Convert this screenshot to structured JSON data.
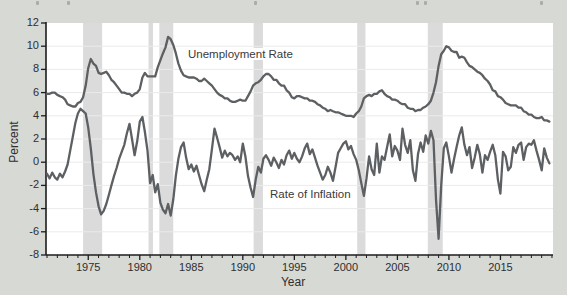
{
  "figure": {
    "ylabel": "Percent",
    "xlabel": "Year",
    "unemployment_label": "Unemployment Rate",
    "inflation_label": "Rate of Inflation"
  },
  "chart_data": {
    "type": "line",
    "title": "",
    "xlabel": "Year",
    "ylabel": "Percent",
    "xlim": [
      1970.9,
      2020.1
    ],
    "ylim": [
      -8,
      12
    ],
    "x_ticks": [
      1975,
      1980,
      1985,
      1990,
      1995,
      2000,
      2005,
      2010,
      2015
    ],
    "y_ticks": [
      12,
      10,
      8,
      6,
      4,
      2,
      0,
      -2,
      -4,
      -6,
      -8
    ],
    "grid": true,
    "x_start_year": 1971,
    "points_per_year": 4,
    "recession_bands": [
      [
        1974.5,
        1976.35
      ],
      [
        1980.85,
        1981.28
      ],
      [
        1981.9,
        1983.25
      ],
      [
        1991.05,
        1991.95
      ],
      [
        2001.1,
        2001.9
      ],
      [
        2007.95,
        2009.4
      ]
    ],
    "series": [
      {
        "name": "Unemployment Rate",
        "values": [
          5.9,
          5.9,
          6.0,
          6.0,
          5.8,
          5.7,
          5.6,
          5.4,
          5.0,
          4.9,
          4.8,
          4.8,
          5.1,
          5.2,
          5.6,
          6.6,
          8.1,
          8.9,
          8.5,
          8.3,
          7.7,
          7.6,
          7.7,
          7.8,
          7.5,
          7.1,
          6.9,
          6.6,
          6.3,
          6.0,
          6.0,
          5.9,
          5.9,
          5.7,
          5.9,
          6.0,
          6.3,
          7.3,
          7.7,
          7.4,
          7.4,
          7.4,
          7.4,
          8.2,
          8.8,
          9.4,
          9.9,
          10.8,
          10.6,
          10.1,
          9.4,
          8.5,
          7.9,
          7.5,
          7.4,
          7.3,
          7.3,
          7.3,
          7.2,
          7.0,
          7.0,
          7.2,
          7.0,
          6.8,
          6.6,
          6.3,
          6.0,
          5.8,
          5.7,
          5.5,
          5.5,
          5.3,
          5.2,
          5.2,
          5.3,
          5.4,
          5.3,
          5.3,
          5.7,
          6.1,
          6.6,
          6.8,
          6.9,
          7.1,
          7.4,
          7.6,
          7.6,
          7.4,
          7.1,
          7.1,
          6.8,
          6.6,
          6.6,
          6.2,
          6.0,
          5.6,
          5.5,
          5.7,
          5.7,
          5.6,
          5.5,
          5.5,
          5.3,
          5.3,
          5.2,
          5.0,
          4.9,
          4.7,
          4.6,
          4.4,
          4.5,
          4.4,
          4.3,
          4.3,
          4.2,
          4.1,
          4.0,
          4.0,
          4.0,
          3.9,
          4.2,
          4.4,
          4.8,
          5.5,
          5.7,
          5.8,
          5.7,
          5.9,
          5.9,
          6.1,
          6.2,
          5.9,
          5.7,
          5.6,
          5.4,
          5.4,
          5.3,
          5.1,
          5.0,
          5.0,
          4.7,
          4.6,
          4.6,
          4.4,
          4.5,
          4.5,
          4.7,
          4.8,
          5.0,
          5.3,
          6.0,
          6.9,
          8.3,
          9.3,
          9.6,
          10.0,
          9.9,
          9.6,
          9.5,
          9.5,
          9.0,
          9.1,
          9.0,
          8.6,
          8.3,
          8.2,
          8.0,
          7.8,
          7.7,
          7.5,
          7.2,
          7.0,
          6.7,
          6.2,
          6.1,
          5.7,
          5.6,
          5.4,
          5.1,
          5.0,
          4.9,
          4.9,
          4.9,
          4.7,
          4.7,
          4.4,
          4.3,
          4.1,
          4.1,
          3.9,
          3.8,
          3.8,
          3.9,
          3.6,
          3.6,
          3.5
        ]
      },
      {
        "name": "Rate of Inflation",
        "values": [
          -1.0,
          -1.4,
          -0.9,
          -1.3,
          -1.5,
          -1.0,
          -1.3,
          -0.8,
          -0.2,
          1.0,
          2.2,
          3.4,
          4.2,
          4.6,
          4.4,
          4.2,
          3.0,
          1.2,
          -1.0,
          -2.6,
          -3.8,
          -4.5,
          -4.2,
          -3.6,
          -2.8,
          -2.0,
          -1.2,
          -0.5,
          0.3,
          0.9,
          1.5,
          2.5,
          3.3,
          2.0,
          0.6,
          1.8,
          3.5,
          3.9,
          2.6,
          1.0,
          -1.8,
          -1.1,
          -2.6,
          -1.9,
          -3.5,
          -4.1,
          -4.4,
          -3.6,
          -4.6,
          -3.2,
          -1.2,
          0.3,
          1.3,
          1.7,
          0.4,
          -0.6,
          -0.2,
          -0.8,
          -0.3,
          -1.1,
          -1.9,
          -2.5,
          -1.5,
          -0.6,
          1.1,
          2.9,
          2.1,
          1.3,
          0.4,
          1.0,
          0.5,
          0.8,
          0.6,
          0.2,
          0.5,
          0.0,
          1.6,
          0.5,
          -1.2,
          -2.2,
          -3.0,
          -1.5,
          -0.4,
          -0.9,
          0.3,
          0.6,
          0.2,
          -0.3,
          0.4,
          0.0,
          -0.5,
          0.2,
          -0.2,
          0.6,
          1.0,
          0.3,
          0.8,
          0.3,
          0.0,
          0.5,
          1.2,
          1.6,
          0.7,
          1.1,
          0.4,
          -0.3,
          -0.9,
          -1.5,
          -1.1,
          -0.4,
          -0.9,
          -1.6,
          -0.4,
          0.8,
          1.2,
          1.6,
          1.8,
          1.1,
          1.4,
          0.7,
          0.2,
          -0.7,
          -1.8,
          -2.9,
          -1.4,
          0.5,
          -0.6,
          -1.1,
          1.6,
          -0.9,
          0.5,
          0.2,
          1.3,
          2.4,
          0.5,
          1.4,
          1.0,
          0.2,
          2.9,
          1.5,
          0.8,
          1.9,
          -0.7,
          -1.6,
          0.7,
          1.7,
          0.9,
          2.3,
          1.6,
          2.7,
          1.9,
          -3.2,
          -6.6,
          -2.0,
          1.2,
          1.7,
          0.5,
          -0.9,
          0.3,
          1.3,
          2.3,
          3.0,
          1.5,
          0.6,
          1.3,
          -0.5,
          0.4,
          1.5,
          0.7,
          -0.9,
          0.6,
          0.2,
          0.9,
          1.5,
          0.6,
          -1.5,
          -2.7,
          0.9,
          0.5,
          -0.7,
          -0.4,
          1.3,
          0.8,
          1.5,
          1.7,
          0.2,
          1.3,
          1.6,
          1.5,
          1.9,
          1.0,
          0.2,
          -0.7,
          1.2,
          0.4,
          -0.1
        ]
      }
    ],
    "colors": {
      "line": "#5d6063",
      "band": "#dbdbdb",
      "grid": "#ebebeb",
      "plot_bg": "#ffffff",
      "page_bg": "#d7d9d5",
      "axis": "#1c1c1c",
      "text": "#2e2e2e"
    }
  }
}
